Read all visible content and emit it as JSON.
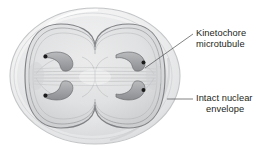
{
  "figure": {
    "background_color": "#ffffff"
  },
  "labels": {
    "kinetochore": {
      "line1": "Kinetochore",
      "line2": "microtubule",
      "name": "kinetochore-microtubule-label",
      "leader": "diagonal"
    },
    "envelope": {
      "line1": "Intact nuclear",
      "line2": "envelope",
      "name": "intact-nuclear-envelope-label",
      "leader": "horizontal"
    }
  },
  "colors": {
    "text": "#231f20",
    "leader_line": "#58595b",
    "cell_outline": "#bcbec0",
    "cell_fill": "#f2f2f2",
    "cytoplasm_fill": "#e4e5e6",
    "nucleus_fill": "#dcdddf",
    "nucleus_outline": "#808285",
    "chromosome_fill": "#a7a9ac",
    "chromosome_outline": "#6d6e71",
    "kinetochore_dot": "#1a1a1a",
    "spindle_fiber": "#b0b2b4"
  },
  "structures": {
    "cell": "outer-cell-membrane",
    "nuclear_envelope": "peanut-shaped-nuclear-envelope",
    "chromosomes": [
      {
        "name": "chromosome-top-left",
        "kinetochore": "kinetochore-dot-top-left"
      },
      {
        "name": "chromosome-top-right",
        "kinetochore": "kinetochore-dot-top-right"
      },
      {
        "name": "chromosome-bottom-left",
        "kinetochore": "kinetochore-dot-bottom-left"
      },
      {
        "name": "chromosome-bottom-right",
        "kinetochore": "kinetochore-dot-bottom-right"
      }
    ],
    "spindle": "interpolar-spindle-fibers",
    "chromosome_count": 4
  }
}
